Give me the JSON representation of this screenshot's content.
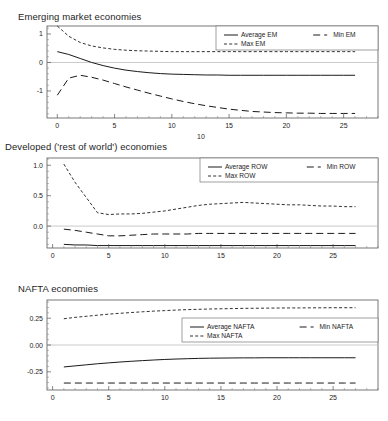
{
  "figure": {
    "stray_label": "10"
  },
  "panels": [
    {
      "id": "em",
      "title": "Emerging market economies",
      "legend": {
        "avg": "Average EM",
        "min": "Min EM",
        "max": "Max EM"
      },
      "chart_data": {
        "type": "line",
        "title": "Emerging market economies",
        "xlabel": "",
        "ylabel": "",
        "xlim": [
          -0.9,
          28
        ],
        "ylim": [
          -1.95,
          1.28
        ],
        "xticks": [
          0,
          5,
          10,
          15,
          20,
          25
        ],
        "yticks": [
          1,
          0,
          -1
        ],
        "ytick_labels": [
          "1",
          "0",
          "-1"
        ],
        "grid": false,
        "zeroline": true,
        "legend_position": "top-right",
        "x": [
          0,
          1,
          2,
          3,
          4,
          5,
          6,
          7,
          8,
          9,
          10,
          11,
          12,
          13,
          14,
          15,
          16,
          17,
          18,
          19,
          20,
          21,
          22,
          23,
          24,
          25,
          26
        ],
        "series": [
          {
            "name": "Average EM",
            "style": "solid",
            "values": [
              0.38,
              0.28,
              0.14,
              0.0,
              -0.11,
              -0.2,
              -0.27,
              -0.32,
              -0.36,
              -0.39,
              -0.41,
              -0.42,
              -0.43,
              -0.44,
              -0.44,
              -0.45,
              -0.45,
              -0.45,
              -0.45,
              -0.45,
              -0.45,
              -0.45,
              -0.45,
              -0.45,
              -0.45,
              -0.45,
              -0.45
            ]
          },
          {
            "name": "Max EM",
            "style": "dotted",
            "values": [
              1.28,
              0.92,
              0.7,
              0.58,
              0.51,
              0.46,
              0.43,
              0.41,
              0.4,
              0.39,
              0.38,
              0.38,
              0.38,
              0.38,
              0.38,
              0.38,
              0.38,
              0.38,
              0.38,
              0.38,
              0.38,
              0.38,
              0.38,
              0.38,
              0.38,
              0.38,
              0.38
            ]
          },
          {
            "name": "Min EM",
            "style": "dashed",
            "values": [
              -1.15,
              -0.55,
              -0.45,
              -0.52,
              -0.62,
              -0.74,
              -0.86,
              -0.97,
              -1.08,
              -1.18,
              -1.28,
              -1.37,
              -1.45,
              -1.52,
              -1.58,
              -1.64,
              -1.68,
              -1.72,
              -1.74,
              -1.76,
              -1.77,
              -1.78,
              -1.78,
              -1.79,
              -1.79,
              -1.79,
              -1.79
            ]
          }
        ]
      }
    },
    {
      "id": "row",
      "title": "Developed ('rest of world') economies",
      "legend": {
        "avg": "Average ROW",
        "min": "Min ROW",
        "max": "Max ROW"
      },
      "chart_data": {
        "type": "line",
        "title": "Developed ('rest of world') economies",
        "xlabel": "",
        "ylabel": "",
        "xlim": [
          -0.5,
          29
        ],
        "ylim": [
          -0.36,
          1.12
        ],
        "xticks": [
          0,
          5,
          10,
          15,
          20,
          25
        ],
        "yticks": [
          1.0,
          0.5,
          0.0
        ],
        "ytick_labels": [
          "1.0",
          "0.5",
          "0.0"
        ],
        "grid": false,
        "zeroline": true,
        "legend_position": "top-right",
        "x": [
          1,
          2,
          3,
          4,
          5,
          6,
          7,
          8,
          9,
          10,
          11,
          12,
          13,
          14,
          15,
          16,
          17,
          18,
          19,
          20,
          21,
          22,
          23,
          24,
          25,
          26,
          27
        ],
        "series": [
          {
            "name": "Average ROW",
            "style": "solid",
            "values": [
              -0.3,
              -0.31,
              -0.31,
              -0.32,
              -0.32,
              -0.32,
              -0.32,
              -0.32,
              -0.32,
              -0.32,
              -0.32,
              -0.32,
              -0.32,
              -0.32,
              -0.32,
              -0.32,
              -0.32,
              -0.32,
              -0.32,
              -0.32,
              -0.32,
              -0.32,
              -0.32,
              -0.32,
              -0.32,
              -0.32,
              -0.32
            ]
          },
          {
            "name": "Max ROW",
            "style": "dotted",
            "values": [
              1.02,
              0.72,
              0.47,
              0.22,
              0.19,
              0.2,
              0.2,
              0.21,
              0.23,
              0.25,
              0.28,
              0.31,
              0.34,
              0.36,
              0.37,
              0.38,
              0.39,
              0.38,
              0.37,
              0.36,
              0.35,
              0.35,
              0.34,
              0.33,
              0.33,
              0.32,
              0.32
            ]
          },
          {
            "name": "Min ROW",
            "style": "dashed",
            "values": [
              -0.05,
              -0.07,
              -0.1,
              -0.13,
              -0.16,
              -0.16,
              -0.15,
              -0.14,
              -0.13,
              -0.13,
              -0.13,
              -0.13,
              -0.12,
              -0.12,
              -0.12,
              -0.12,
              -0.12,
              -0.12,
              -0.12,
              -0.12,
              -0.12,
              -0.12,
              -0.12,
              -0.12,
              -0.12,
              -0.12,
              -0.12
            ]
          }
        ]
      }
    },
    {
      "id": "nafta",
      "title": "NAFTA economies",
      "legend": {
        "avg": "Average NAFTA",
        "min": "Min NAFTA",
        "max": "Max NAFTA"
      },
      "chart_data": {
        "type": "line",
        "title": "NAFTA economies",
        "xlabel": "",
        "ylabel": "",
        "xlim": [
          -0.5,
          29
        ],
        "ylim": [
          -0.42,
          0.42
        ],
        "xticks": [
          0,
          5,
          10,
          15,
          20,
          25
        ],
        "yticks": [
          0.25,
          0.0,
          -0.25
        ],
        "ytick_labels": [
          "0.25",
          "0.00",
          "-0.25"
        ],
        "grid": false,
        "zeroline": true,
        "legend_position": "center-right",
        "x": [
          1,
          2,
          3,
          4,
          5,
          6,
          7,
          8,
          9,
          10,
          11,
          12,
          13,
          14,
          15,
          16,
          17,
          18,
          19,
          20,
          21,
          22,
          23,
          24,
          25,
          26,
          27
        ],
        "series": [
          {
            "name": "Average NAFTA",
            "style": "solid",
            "values": [
              -0.205,
              -0.195,
              -0.185,
              -0.175,
              -0.167,
              -0.159,
              -0.152,
              -0.146,
              -0.14,
              -0.135,
              -0.131,
              -0.128,
              -0.125,
              -0.123,
              -0.122,
              -0.121,
              -0.12,
              -0.12,
              -0.119,
              -0.119,
              -0.119,
              -0.119,
              -0.119,
              -0.119,
              -0.119,
              -0.119,
              -0.119
            ]
          },
          {
            "name": "Max NAFTA",
            "style": "dotted",
            "values": [
              0.245,
              0.258,
              0.268,
              0.278,
              0.288,
              0.296,
              0.303,
              0.31,
              0.316,
              0.321,
              0.326,
              0.33,
              0.333,
              0.336,
              0.338,
              0.34,
              0.342,
              0.343,
              0.344,
              0.345,
              0.346,
              0.346,
              0.347,
              0.347,
              0.348,
              0.348,
              0.348
            ]
          },
          {
            "name": "Min NAFTA",
            "style": "dashed",
            "values": [
              -0.355,
              -0.355,
              -0.355,
              -0.355,
              -0.355,
              -0.355,
              -0.355,
              -0.355,
              -0.355,
              -0.355,
              -0.355,
              -0.355,
              -0.355,
              -0.355,
              -0.355,
              -0.355,
              -0.355,
              -0.355,
              -0.355,
              -0.355,
              -0.355,
              -0.355,
              -0.355,
              -0.355,
              -0.355,
              -0.355,
              -0.355
            ]
          }
        ]
      }
    }
  ]
}
